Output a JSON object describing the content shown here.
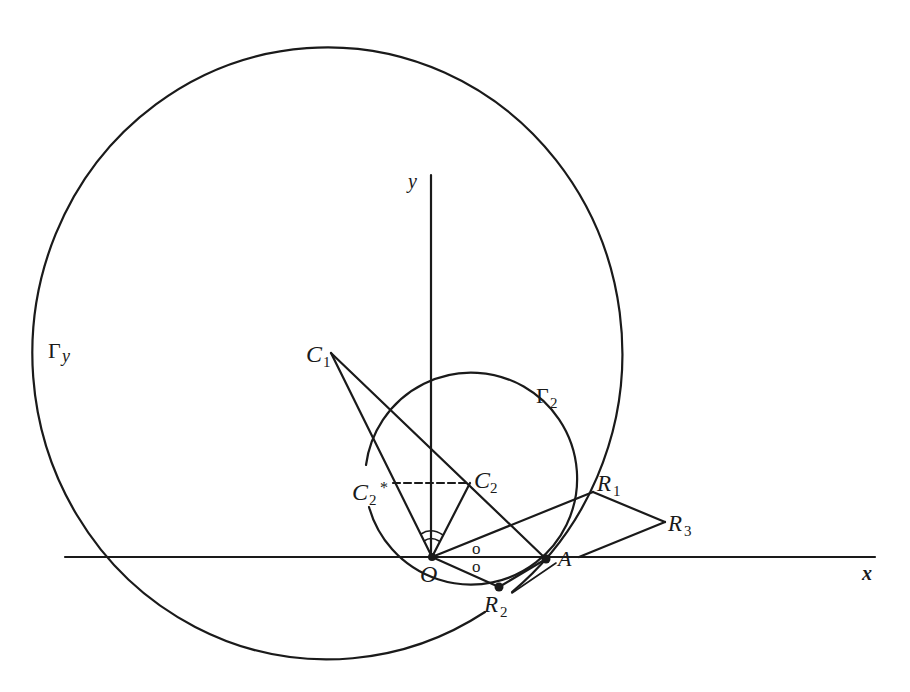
{
  "diagram": {
    "type": "geometric-construction",
    "axes": {
      "x_label": "x",
      "y_label": "y",
      "origin_label": "O",
      "x_axis": {
        "x1": 65,
        "y1": 557,
        "x2": 875,
        "y2": 557
      },
      "y_axis": {
        "x1": 431,
        "y1": 175,
        "x2": 431,
        "y2": 557
      }
    },
    "curves": {
      "gamma_y": {
        "label_main": "Γ",
        "label_sub": "y",
        "cx": 332,
        "cy": 351,
        "rx": 295,
        "ry": 306
      },
      "gamma_2": {
        "label_main": "Γ",
        "label_sub": "2",
        "cx": 470,
        "cy": 483,
        "r": 106
      }
    },
    "points": {
      "O": {
        "label": "O",
        "x": 432,
        "y": 557
      },
      "A": {
        "label": "A",
        "x": 546,
        "y": 559
      },
      "C1": {
        "label_main": "C",
        "label_sub": "1",
        "x": 331,
        "y": 353
      },
      "C2": {
        "label_main": "C",
        "label_sub": "2",
        "x": 470,
        "y": 483
      },
      "C2_star": {
        "label_main": "C",
        "label_sub": "2",
        "label_sup": "*",
        "x": 393,
        "y": 483
      },
      "R1": {
        "label_main": "R",
        "label_sub": "1",
        "x": 593,
        "y": 492
      },
      "R2": {
        "label_main": "R",
        "label_sub": "2",
        "x": 499,
        "y": 587
      },
      "R3": {
        "label_main": "R",
        "label_sub": "3",
        "x": 665,
        "y": 522
      }
    },
    "angle_marks": {
      "equal_angle_symbol_top": "o",
      "equal_angle_symbol_bottom": "o"
    },
    "colors": {
      "ink": "#1a1a1a",
      "background": "#ffffff"
    }
  }
}
